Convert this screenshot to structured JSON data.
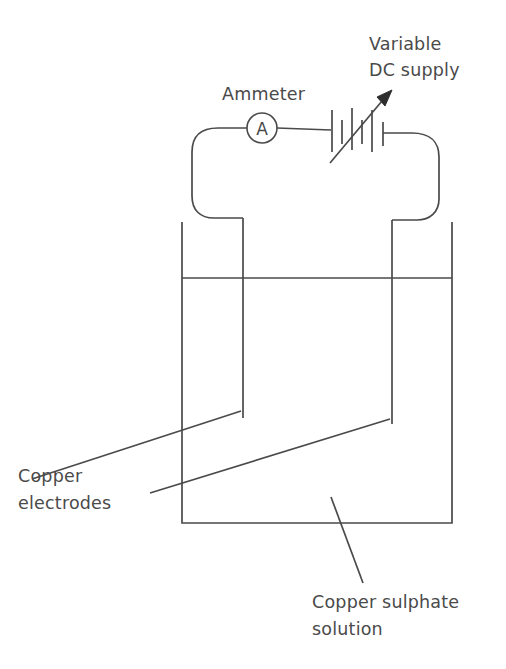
{
  "diagram": {
    "background_color": "#ffffff",
    "line_color": "#4a4a4a",
    "text_color": "#4a4a4a"
  },
  "labels": {
    "ammeter": "Ammeter",
    "supply_line1": "Variable",
    "supply_line2": "DC  supply",
    "electrodes_line1": "Copper",
    "electrodes_line2": "electrodes",
    "solution_line1": "Copper sulphate",
    "solution_line2": "solution"
  },
  "symbols": {
    "ammeter_letter": "A",
    "ammeter_icon": "ammeter-circle-icon",
    "battery_icon": "variable-dc-battery-icon",
    "arrow_icon": "variable-arrow-icon",
    "beaker_icon": "beaker-icon",
    "electrode_left_icon": "copper-electrode-left-icon",
    "electrode_right_icon": "copper-electrode-right-icon",
    "liquid_level_icon": "liquid-surface-line-icon"
  },
  "geometry": {
    "ammeter_center_x": 262,
    "ammeter_center_y": 128,
    "ammeter_radius": 15,
    "battery_center_x": 360,
    "battery_center_y": 132,
    "battery_plate_count": 6,
    "beaker_left_x": 182,
    "beaker_right_x": 452,
    "beaker_top_y": 222,
    "beaker_bottom_y": 523,
    "liquid_level_y": 278,
    "electrode_left_x": 243,
    "electrode_right_x": 392,
    "electrode_left_bottom_y": 418,
    "electrode_right_bottom_y": 424
  }
}
